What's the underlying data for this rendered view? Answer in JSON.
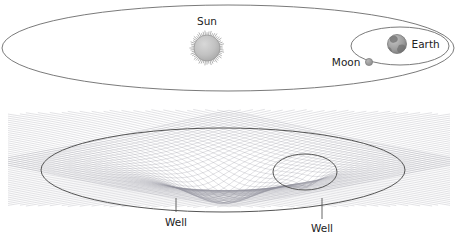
{
  "figure": {
    "title": "",
    "background_color": "#ffffff",
    "width": 456,
    "height": 240
  },
  "panels": [
    {
      "id": "orbital-view",
      "name": "sun-earth-moon-orbital-diagram",
      "description": "Top-down view of Earth's orbit around the Sun with the Moon's orbit around Earth"
    },
    {
      "id": "gravity-well-view",
      "name": "spacetime-curvature-mesh",
      "description": "Warped spacetime grid showing the Sun's gravity well and Earth's smaller gravity well"
    }
  ],
  "labels": {
    "sun": "Sun",
    "earth": "Earth",
    "moon": "Moon",
    "well_sun": "Well",
    "well_earth": "Well"
  },
  "bodies": {
    "sun": {
      "label": "Sun",
      "cx": 207,
      "cy": 48,
      "r": 13,
      "fill": "#bdbdbd",
      "stroke": "#9a9a9a",
      "rays": 52
    },
    "earth": {
      "label": "Earth",
      "cx": 397,
      "cy": 44,
      "r": 9.5,
      "fill": "#a8a8a8",
      "stroke": "#8a8a8a"
    },
    "moon": {
      "label": "Moon",
      "cx": 369,
      "cy": 62,
      "r": 3.6,
      "fill": "#9e9e9e",
      "stroke": "#838383"
    }
  },
  "orbits": {
    "earth_orbit": {
      "cx": 228,
      "cy": 48,
      "rx": 226,
      "ry": 43,
      "stroke": "#6b6b6b"
    },
    "moon_orbit": {
      "cx": 400,
      "cy": 46,
      "rx": 49,
      "ry": 19,
      "stroke": "#6b6b6b"
    }
  },
  "wells": {
    "sun_well": {
      "label": "Well",
      "ellipse": {
        "cx": 223,
        "cy": 170,
        "rx": 182,
        "ry": 42,
        "stroke": "#555555"
      },
      "leader": {
        "x": 176,
        "y1": 198,
        "y2": 212
      },
      "text_x": 176,
      "text_y": 226,
      "depth": 46
    },
    "earth_well": {
      "label": "Well",
      "ellipse": {
        "cx": 305,
        "cy": 172,
        "rx": 32,
        "ry": 18,
        "stroke": "#555555"
      },
      "leader": {
        "x": 322,
        "y1": 198,
        "y2": 219
      },
      "text_x": 322,
      "text_y": 232,
      "depth": 13
    }
  },
  "mesh": {
    "color": "#8e8e9a",
    "dark_color": "#5f5f6b",
    "lines_u": 46,
    "lines_v": 46,
    "x_min": 8,
    "x_max": 450,
    "y_center": 158
  },
  "colors": {
    "ink": "#222222",
    "outline": "#6b6b6b",
    "mesh": "#8e8e9a",
    "body_gray": "#b0b0b0",
    "background": "#ffffff"
  }
}
